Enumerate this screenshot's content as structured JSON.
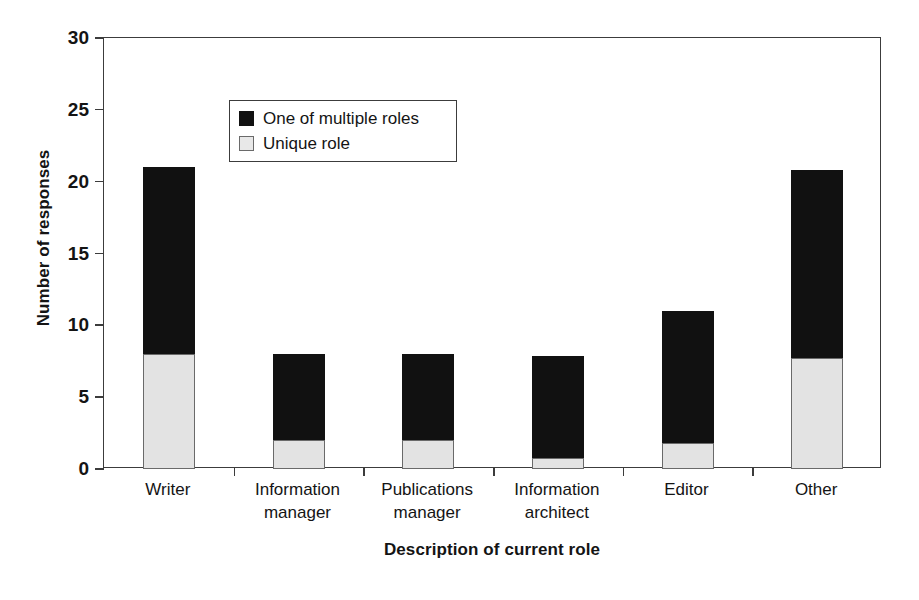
{
  "chart_data": {
    "type": "bar",
    "subtype": "stacked-bar",
    "title": "",
    "xlabel": "Description of current role",
    "ylabel": "Number of responses",
    "ylim": [
      0,
      30
    ],
    "yticks": [
      0,
      5,
      10,
      15,
      20,
      25,
      30
    ],
    "ytick_labels": [
      "0",
      "5",
      "10",
      "15",
      "20",
      "25",
      "30"
    ],
    "grid": false,
    "legend_position": "upper left (inside plot area)",
    "categories": [
      "Writer",
      "Information manager",
      "Publications manager",
      "Information architect",
      "Editor",
      "Other"
    ],
    "category_lines": [
      [
        "Writer",
        ""
      ],
      [
        "Information",
        "manager"
      ],
      [
        "Publications",
        "manager"
      ],
      [
        "Information",
        "architect"
      ],
      [
        "Editor",
        ""
      ],
      [
        "Other",
        ""
      ]
    ],
    "series": [
      {
        "name": "Unique role",
        "color": "#e3e3e3",
        "values": [
          8,
          2,
          2,
          0.8,
          1.8,
          7.7
        ]
      },
      {
        "name": "One of multiple roles",
        "color": "#111111",
        "values": [
          13,
          6,
          6,
          7.1,
          9.2,
          13.1
        ]
      }
    ],
    "totals": [
      21,
      8,
      8,
      7.9,
      11,
      20.8
    ]
  },
  "legend": {
    "entries": [
      {
        "label": "One of multiple roles",
        "swatch": "filled-black-square"
      },
      {
        "label": "Unique role",
        "swatch": "light-gray-square"
      }
    ]
  },
  "axes": {
    "y_title": "Number of responses",
    "x_title": "Description of current role"
  }
}
